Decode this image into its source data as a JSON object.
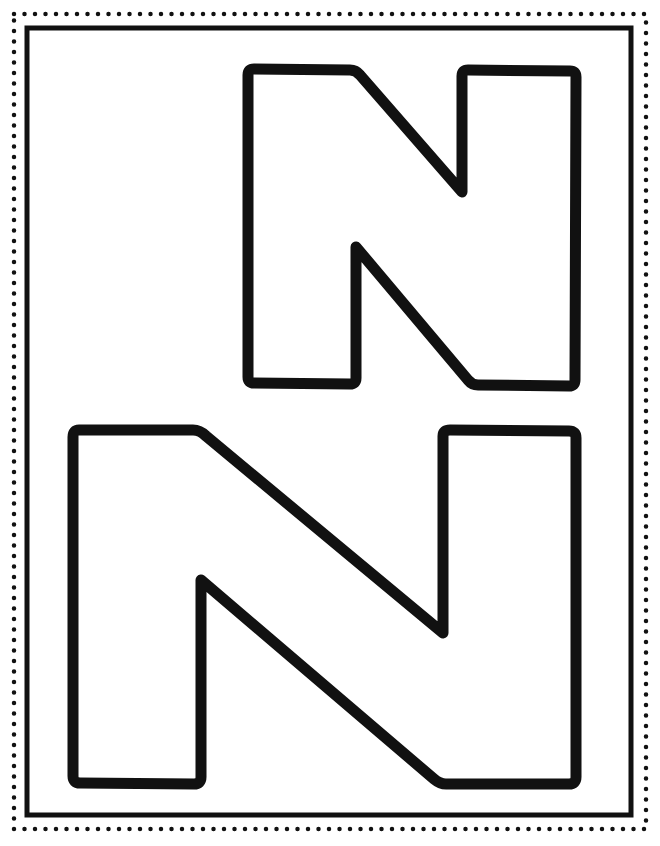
{
  "page": {
    "type": "coloring-page",
    "background": "#ffffff",
    "ink_color": "#111111",
    "border": {
      "outer_style": "dotted",
      "inner_style": "solid"
    },
    "letters": [
      {
        "char": "N",
        "case": "uppercase",
        "style": "outline",
        "size": "small",
        "position": "top-right"
      },
      {
        "char": "N",
        "case": "uppercase",
        "style": "outline",
        "size": "large",
        "position": "bottom"
      }
    ]
  }
}
